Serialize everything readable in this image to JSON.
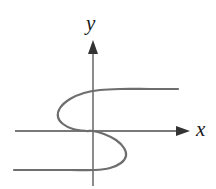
{
  "figure": {
    "title": "",
    "background_color": "#ffffff",
    "width": 216,
    "height": 189
  },
  "axes": {
    "x_axis": {
      "label": "x",
      "icon": "arrow-right-icon",
      "color": "#4d4d4d",
      "y_pixel": 131,
      "x_start": 15,
      "x_end": 190
    },
    "y_axis": {
      "label": "y",
      "icon": "arrow-up-icon",
      "color": "#4d4d4d",
      "x_pixel": 93,
      "y_start": 40,
      "y_end": 186
    },
    "origin": {
      "x": 93,
      "y": 131
    }
  },
  "chart_data": {
    "type": "line",
    "title": "",
    "xlabel": "x",
    "ylabel": "y",
    "grid": false,
    "legend": null,
    "axis_arrows": true,
    "curve": {
      "name": "sideways-cubic",
      "description": "Rotated cubic curve (x as a function of y) forming a sideways S that fails the vertical line test",
      "color": "#6e6e6e",
      "line_width": 2.2,
      "passes_through_origin": true,
      "points": [
        [
          178,
          89
        ],
        [
          150,
          89
        ],
        [
          120,
          89
        ],
        [
          100,
          90
        ],
        [
          84,
          93
        ],
        [
          70,
          99
        ],
        [
          60,
          108
        ],
        [
          58,
          117
        ],
        [
          63,
          124
        ],
        [
          73,
          129
        ],
        [
          86,
          131
        ],
        [
          93,
          131
        ],
        [
          104,
          134
        ],
        [
          116,
          140
        ],
        [
          124,
          148
        ],
        [
          126,
          156
        ],
        [
          121,
          163
        ],
        [
          110,
          168
        ],
        [
          95,
          170
        ],
        [
          70,
          170
        ],
        [
          40,
          170
        ],
        [
          14,
          170
        ]
      ]
    }
  },
  "colors": {
    "axis": "#4d4d4d",
    "curve": "#6e6e6e",
    "label_text": "#1a1a1a",
    "background": "#ffffff"
  }
}
